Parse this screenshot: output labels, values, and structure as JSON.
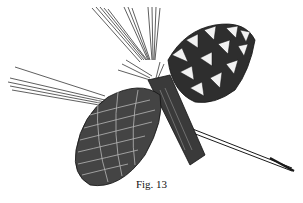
{
  "figure": {
    "caption": "Fig. 13",
    "ink_color": "#1a1a1a",
    "background": "#ffffff"
  }
}
